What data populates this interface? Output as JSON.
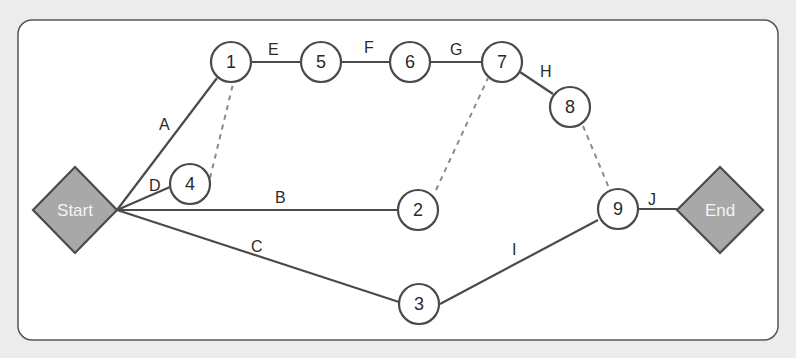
{
  "diagram": {
    "type": "network-diagram",
    "colors": {
      "background": "#ececec",
      "panel": "#ffffff",
      "stroke": "#4a4a4a",
      "terminal_fill": "#a8a8a8",
      "terminal_text": "#f4f4f4",
      "dashed": "#8a8a8a"
    },
    "terminals": {
      "start": {
        "label": "Start"
      },
      "end": {
        "label": "End"
      }
    },
    "nodes": [
      {
        "id": "1",
        "label": "1"
      },
      {
        "id": "2",
        "label": "2"
      },
      {
        "id": "3",
        "label": "3"
      },
      {
        "id": "4",
        "label": "4"
      },
      {
        "id": "5",
        "label": "5"
      },
      {
        "id": "6",
        "label": "6"
      },
      {
        "id": "7",
        "label": "7"
      },
      {
        "id": "8",
        "label": "8"
      },
      {
        "id": "9",
        "label": "9"
      }
    ],
    "activities": [
      {
        "label": "A",
        "from": "Start",
        "to": "1"
      },
      {
        "label": "B",
        "from": "Start",
        "to": "2"
      },
      {
        "label": "C",
        "from": "Start",
        "to": "3"
      },
      {
        "label": "D",
        "from": "Start",
        "to": "4"
      },
      {
        "label": "E",
        "from": "1",
        "to": "5"
      },
      {
        "label": "F",
        "from": "5",
        "to": "6"
      },
      {
        "label": "G",
        "from": "6",
        "to": "7"
      },
      {
        "label": "H",
        "from": "7",
        "to": "8"
      },
      {
        "label": "I",
        "from": "3",
        "to": "9"
      },
      {
        "label": "J",
        "from": "9",
        "to": "End"
      }
    ],
    "dummy_links": [
      {
        "from": "4",
        "to": "1"
      },
      {
        "from": "2",
        "to": "7"
      },
      {
        "from": "8",
        "to": "9"
      }
    ]
  }
}
